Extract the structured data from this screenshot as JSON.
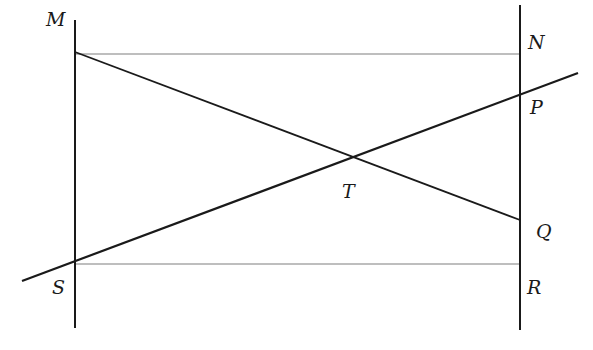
{
  "diagram": {
    "type": "geometry",
    "colors": {
      "main_line": "#1a1a1a",
      "parallel_line": "#a8a8a8",
      "background": "#ffffff"
    },
    "points": {
      "M": {
        "label": "M",
        "x": 75,
        "y": 52
      },
      "N": {
        "label": "N",
        "x": 520,
        "y": 54
      },
      "P": {
        "label": "P",
        "x": 520,
        "y": 95
      },
      "Q": {
        "label": "Q",
        "x": 520,
        "y": 220
      },
      "R": {
        "label": "R",
        "x": 520,
        "y": 264
      },
      "S": {
        "label": "S",
        "x": 75,
        "y": 262
      },
      "T": {
        "label": "T",
        "x": 352,
        "y": 157
      }
    },
    "labels": {
      "M": "M",
      "N": "N",
      "P": "P",
      "Q": "Q",
      "R": "R",
      "S": "S",
      "T": "T"
    },
    "segments": [
      {
        "name": "left-vertical-line",
        "from": [
          75,
          20
        ],
        "to": [
          75,
          328
        ],
        "style": "main"
      },
      {
        "name": "right-vertical-line",
        "from": [
          520,
          5
        ],
        "to": [
          520,
          330
        ],
        "style": "main"
      },
      {
        "name": "segment-MQ",
        "from": [
          75,
          52
        ],
        "to": [
          520,
          220
        ],
        "style": "main"
      },
      {
        "name": "line-SP",
        "from": [
          22,
          281
        ],
        "to": [
          578,
          73
        ],
        "style": "main"
      },
      {
        "name": "segment-MN",
        "from": [
          75,
          54
        ],
        "to": [
          520,
          54
        ],
        "style": "parallel"
      },
      {
        "name": "segment-SR",
        "from": [
          75,
          264
        ],
        "to": [
          520,
          264
        ],
        "style": "parallel"
      }
    ]
  }
}
